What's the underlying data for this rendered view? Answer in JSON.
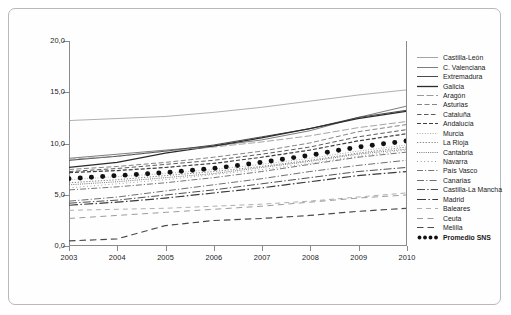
{
  "chart_data": {
    "type": "line",
    "title": "",
    "subtitle": "",
    "xlabel": "",
    "ylabel": "",
    "x": [
      2003,
      2004,
      2005,
      2006,
      2007,
      2008,
      2009,
      2010
    ],
    "xticklabels": [
      "2003",
      "2004",
      "2005",
      "2006",
      "2007",
      "2008",
      "2009",
      "2010"
    ],
    "yticklabels": [
      "0,0",
      "5,0",
      "10,0",
      "15,0",
      "20,0"
    ],
    "yticks": [
      0,
      5,
      10,
      15,
      20
    ],
    "ylim": [
      0,
      20
    ],
    "xlim": [
      2003,
      2010
    ],
    "grid": false,
    "legend_position": "right",
    "series": [
      {
        "name": "Castilla-León",
        "style": "solid",
        "color": "#9a9a9a",
        "width": 0.8,
        "values": [
          12.2,
          12.4,
          12.6,
          13.0,
          13.5,
          14.1,
          14.7,
          15.2
        ]
      },
      {
        "name": "C. Valenciana",
        "style": "solid",
        "color": "#6f6f6f",
        "width": 0.9,
        "values": [
          8.5,
          8.9,
          9.3,
          9.7,
          10.3,
          11.2,
          12.5,
          13.6
        ]
      },
      {
        "name": "Extremadura",
        "style": "solid",
        "color": "#4a4a4a",
        "width": 1.0,
        "values": [
          8.3,
          8.7,
          9.2,
          9.8,
          10.6,
          11.4,
          12.5,
          13.2
        ]
      },
      {
        "name": "Galicia",
        "style": "solid",
        "color": "#2b2b2b",
        "width": 1.3,
        "values": [
          7.6,
          8.1,
          9.0,
          9.7,
          10.5,
          11.4,
          12.4,
          13.1
        ]
      },
      {
        "name": "Aragón",
        "style": "dash-long",
        "color": "#8e8e8e",
        "width": 0.8,
        "values": [
          8.4,
          8.7,
          9.2,
          9.6,
          10.1,
          10.7,
          11.5,
          12.1
        ]
      },
      {
        "name": "Asturias",
        "style": "dash-med",
        "color": "#777777",
        "width": 0.9,
        "values": [
          7.4,
          7.7,
          8.1,
          8.6,
          9.2,
          10.0,
          11.1,
          11.8
        ]
      },
      {
        "name": "Cataluña",
        "style": "dash-med2",
        "color": "#5a5a5a",
        "width": 1.0,
        "values": [
          7.2,
          7.5,
          7.9,
          8.3,
          8.9,
          9.6,
          10.6,
          11.3
        ]
      },
      {
        "name": "Andalucía",
        "style": "dash-thick",
        "color": "#3d3d3d",
        "width": 1.2,
        "values": [
          7.1,
          7.3,
          7.6,
          8.0,
          8.6,
          9.3,
          10.2,
          10.9
        ]
      },
      {
        "name": "Murcia",
        "style": "dot-fine",
        "color": "#9c9c9c",
        "width": 0.8,
        "values": [
          6.4,
          6.7,
          7.0,
          7.4,
          7.9,
          8.5,
          9.2,
          9.8
        ]
      },
      {
        "name": "La Rioja",
        "style": "dot-sq",
        "color": "#777777",
        "width": 0.9,
        "values": [
          6.1,
          6.4,
          6.8,
          7.2,
          7.7,
          8.3,
          9.0,
          9.6
        ]
      },
      {
        "name": "Cantabria",
        "style": "dot-dense",
        "color": "#6a6a6a",
        "width": 0.9,
        "values": [
          5.9,
          6.2,
          6.6,
          7.0,
          7.6,
          8.2,
          8.9,
          9.4
        ]
      },
      {
        "name": "Navarra",
        "style": "dot-sparse",
        "color": "#8c8c8c",
        "width": 0.8,
        "values": [
          5.6,
          6.0,
          6.4,
          6.9,
          7.4,
          8.0,
          8.7,
          9.3
        ]
      },
      {
        "name": "País Vasco",
        "style": "dashdot",
        "color": "#666666",
        "width": 0.9,
        "values": [
          5.4,
          5.7,
          6.1,
          6.6,
          7.2,
          7.9,
          8.6,
          9.1
        ]
      },
      {
        "name": "Canarias",
        "style": "dashdot-2",
        "color": "#6e6e6e",
        "width": 1.0,
        "values": [
          4.3,
          4.7,
          5.3,
          5.9,
          6.5,
          7.2,
          7.8,
          8.3
        ]
      },
      {
        "name": "Castilla-La Mancha",
        "style": "dashdot-3",
        "color": "#4f4f4f",
        "width": 1.0,
        "values": [
          4.1,
          4.4,
          4.9,
          5.4,
          6.0,
          6.6,
          7.2,
          7.6
        ]
      },
      {
        "name": "Madrid",
        "style": "dashdot-4",
        "color": "#3a3a3a",
        "width": 1.2,
        "values": [
          3.9,
          4.2,
          4.6,
          5.1,
          5.6,
          6.2,
          6.8,
          7.2
        ]
      },
      {
        "name": "Baleares",
        "style": "dash-gap-lt",
        "color": "#a5a5a5",
        "width": 0.9,
        "values": [
          3.4,
          3.5,
          3.6,
          3.8,
          4.0,
          4.3,
          4.7,
          5.1
        ]
      },
      {
        "name": "Ceuta",
        "style": "dash-gap-md",
        "color": "#9a9a9a",
        "width": 1.0,
        "values": [
          2.6,
          2.9,
          3.2,
          3.5,
          3.8,
          4.2,
          4.6,
          4.9
        ]
      },
      {
        "name": "Melilla",
        "style": "dash-gap-dk",
        "color": "#4a4a4a",
        "width": 1.2,
        "values": [
          0.4,
          0.6,
          1.9,
          2.4,
          2.6,
          2.9,
          3.3,
          3.6
        ]
      },
      {
        "name": "Promedio SNS",
        "style": "dots-marker",
        "color": "#111111",
        "width": 0,
        "values": [
          6.5,
          6.8,
          7.1,
          7.5,
          8.1,
          8.8,
          9.6,
          10.2
        ]
      }
    ]
  },
  "legend": {
    "items": [
      {
        "label": "Castilla-León"
      },
      {
        "label": "C. Valenciana"
      },
      {
        "label": "Extremadura"
      },
      {
        "label": "Galicia"
      },
      {
        "label": "Aragón"
      },
      {
        "label": "Asturias"
      },
      {
        "label": "Cataluña"
      },
      {
        "label": "Andalucía"
      },
      {
        "label": "Murcia"
      },
      {
        "label": "La Rioja"
      },
      {
        "label": "Cantabria"
      },
      {
        "label": "Navarra"
      },
      {
        "label": "País Vasco"
      },
      {
        "label": "Canarias"
      },
      {
        "label": "Castilla-La Mancha"
      },
      {
        "label": "Madrid"
      },
      {
        "label": "Baleares"
      },
      {
        "label": "Ceuta"
      },
      {
        "label": "Melilla"
      },
      {
        "label": "Promedio SNS"
      }
    ]
  }
}
